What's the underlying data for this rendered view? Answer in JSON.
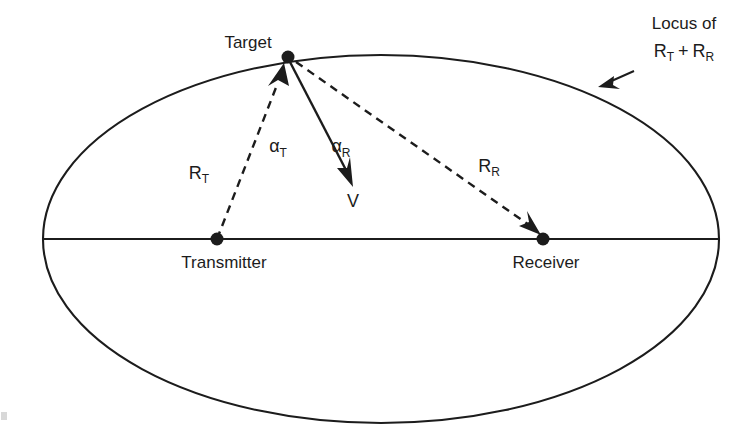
{
  "figure": {
    "background_color": "#ffffff",
    "ink_color": "#1c1c1c"
  },
  "labels": {
    "target": "Target",
    "transmitter": "Transmitter",
    "receiver": "Receiver",
    "locus_line1": "Locus of",
    "locus_line2_r": "R",
    "locus_line2_t_sub": "T",
    "locus_line2_plus": "+",
    "locus_line2_r2": "R",
    "locus_line2_r_sub": "R",
    "range_transmit_base": "R",
    "range_transmit_sub": "T",
    "range_receive_base": "R",
    "range_receive_sub": "R",
    "angle_transmit_base": "α",
    "angle_transmit_sub": "T",
    "angle_receive_base": "α",
    "angle_receive_sub": "R",
    "velocity": "V"
  },
  "geometry": {
    "ellipse": {
      "center_x": 381,
      "center_y": 239,
      "radius_x": 338,
      "radius_y": 184
    },
    "baseline": {
      "x1": 43,
      "y1": 239,
      "x2": 719,
      "y2": 239
    },
    "target_point": {
      "x": 288,
      "y": 57
    },
    "transmitter_point": {
      "x": 217,
      "y": 239
    },
    "receiver_point": {
      "x": 543,
      "y": 239
    },
    "velocity_vector": {
      "x1": 290,
      "y1": 62,
      "x2": 352,
      "y2": 183
    },
    "locus_leader": {
      "x1": 634,
      "y1": 71,
      "x2": 600,
      "y2": 86
    }
  },
  "text_positions": {
    "target": {
      "x": 248,
      "y": 48
    },
    "transmitter": {
      "x": 224,
      "y": 268
    },
    "receiver": {
      "x": 546,
      "y": 268
    },
    "locus_line1": {
      "x": 684,
      "y": 29
    },
    "locus_line2": {
      "x": 684,
      "y": 55
    },
    "range_transmit": {
      "x": 199,
      "y": 179
    },
    "range_receive": {
      "x": 489,
      "y": 172
    },
    "angle_transmit": {
      "x": 278,
      "y": 152
    },
    "angle_receive": {
      "x": 341,
      "y": 152
    },
    "velocity": {
      "x": 353,
      "y": 207
    }
  }
}
